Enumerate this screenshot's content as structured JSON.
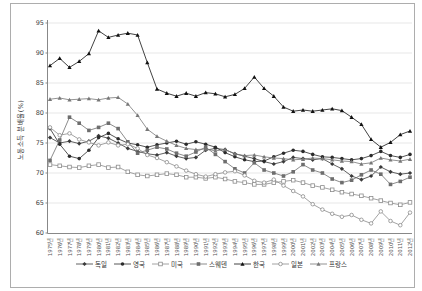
{
  "figure": {
    "border_color": "#adadad",
    "background": "#ffffff",
    "title": ""
  },
  "chart_data": {
    "type": "line",
    "title": "",
    "xlabel": "",
    "ylabel": "노동소득 분배율(%)",
    "ylim": [
      60,
      95
    ],
    "yticks": [
      60,
      65,
      70,
      75,
      80,
      85,
      90,
      95
    ],
    "grid": "horizontal",
    "gridline_color": "#dcdcdc",
    "axis_color": "#888888",
    "legend_position": "bottom",
    "categories": [
      "1975년",
      "1976년",
      "1977년",
      "1978년",
      "1979년",
      "1980년",
      "1981년",
      "1982년",
      "1983년",
      "1984년",
      "1985년",
      "1986년",
      "1987년",
      "1988년",
      "1989년",
      "1990년",
      "1991년",
      "1992년",
      "1993년",
      "1994년",
      "1995년",
      "1996년",
      "1997년",
      "1998년",
      "1999년",
      "2000년",
      "2001년",
      "2002년",
      "2003년",
      "2004년",
      "2005년",
      "2006년",
      "2007년",
      "2008년",
      "2009년",
      "2010년",
      "2011년",
      "2012년"
    ],
    "series": [
      {
        "id": "germany",
        "name": "독일",
        "marker": "diamond",
        "color": "#3a3a3a",
        "values": [
          75.9,
          75.0,
          75.3,
          74.9,
          75.3,
          76.2,
          75.8,
          75.0,
          74.1,
          73.6,
          73.2,
          73.0,
          73.4,
          72.8,
          72.4,
          72.6,
          73.8,
          74.1,
          73.9,
          73.2,
          72.8,
          72.4,
          71.9,
          71.5,
          71.9,
          72.6,
          72.4,
          72.2,
          72.4,
          71.5,
          70.7,
          69.5,
          68.9,
          69.5,
          71.0,
          70.2,
          69.8,
          70.0
        ]
      },
      {
        "id": "uk",
        "name": "영국",
        "marker": "circle",
        "color": "#2b2b2b",
        "values": [
          77.4,
          74.8,
          72.8,
          72.4,
          73.8,
          75.9,
          76.6,
          75.7,
          75.0,
          74.7,
          74.3,
          74.7,
          75.0,
          75.3,
          74.8,
          75.2,
          74.8,
          74.3,
          73.4,
          72.7,
          72.2,
          71.9,
          72.0,
          72.7,
          73.3,
          73.8,
          73.6,
          73.1,
          72.7,
          72.6,
          72.4,
          72.2,
          72.4,
          72.9,
          73.6,
          72.9,
          72.6,
          73.1
        ]
      },
      {
        "id": "usa",
        "name": "미국",
        "marker": "square-open",
        "color": "#8c8c8c",
        "values": [
          71.4,
          71.2,
          71.0,
          70.9,
          71.2,
          71.4,
          70.9,
          71.0,
          70.2,
          69.7,
          69.5,
          69.7,
          69.9,
          69.7,
          69.3,
          69.3,
          69.1,
          69.3,
          69.0,
          68.6,
          68.4,
          68.1,
          68.1,
          68.4,
          68.6,
          68.8,
          68.4,
          67.9,
          67.6,
          67.2,
          66.8,
          66.5,
          66.2,
          65.8,
          65.4,
          65.0,
          64.7,
          65.1
        ]
      },
      {
        "id": "sweden",
        "name": "스웨덴",
        "marker": "square",
        "color": "#6e6e6e",
        "values": [
          72.1,
          75.5,
          79.3,
          78.3,
          77.1,
          77.6,
          78.3,
          77.4,
          75.2,
          73.3,
          73.8,
          74.3,
          74.0,
          73.3,
          72.8,
          73.5,
          74.3,
          73.1,
          71.9,
          70.7,
          70.0,
          71.7,
          70.5,
          70.0,
          69.5,
          70.2,
          71.4,
          70.5,
          70.0,
          69.0,
          68.4,
          68.8,
          69.7,
          70.5,
          69.8,
          68.1,
          68.6,
          69.3
        ]
      },
      {
        "id": "korea",
        "name": "한국",
        "marker": "triangle",
        "color": "#111111",
        "values": [
          87.9,
          89.1,
          87.6,
          88.6,
          89.9,
          93.7,
          92.6,
          93.0,
          93.3,
          93.0,
          88.4,
          84.0,
          83.3,
          82.8,
          83.3,
          82.8,
          83.4,
          83.2,
          82.7,
          83.1,
          84.1,
          86.0,
          84.1,
          82.8,
          81.0,
          80.3,
          80.5,
          80.3,
          80.5,
          80.7,
          80.4,
          79.3,
          78.1,
          75.6,
          74.3,
          75.1,
          76.4,
          77.0
        ]
      },
      {
        "id": "japan",
        "name": "일본",
        "marker": "circle-open",
        "color": "#8c8c8c",
        "values": [
          77.6,
          76.3,
          76.6,
          75.6,
          75.1,
          74.6,
          75.1,
          74.6,
          74.8,
          74.1,
          73.0,
          72.5,
          71.8,
          71.1,
          70.4,
          69.8,
          69.4,
          69.8,
          70.1,
          70.3,
          69.6,
          68.7,
          68.4,
          68.9,
          67.9,
          67.0,
          66.1,
          64.8,
          63.9,
          63.2,
          62.7,
          63.0,
          62.2,
          61.6,
          63.6,
          62.0,
          61.3,
          63.4
        ]
      },
      {
        "id": "france",
        "name": "프랑스",
        "marker": "triangle",
        "color": "#777777",
        "values": [
          82.3,
          82.5,
          82.2,
          82.3,
          82.4,
          82.2,
          82.5,
          82.6,
          81.5,
          79.6,
          77.3,
          76.1,
          75.3,
          74.6,
          74.1,
          73.9,
          74.0,
          73.7,
          73.9,
          73.2,
          72.9,
          73.0,
          72.7,
          72.5,
          72.4,
          72.2,
          72.3,
          72.5,
          72.4,
          72.2,
          72.0,
          71.9,
          71.5,
          71.7,
          72.5,
          72.2,
          72.0,
          72.3
        ]
      }
    ]
  }
}
